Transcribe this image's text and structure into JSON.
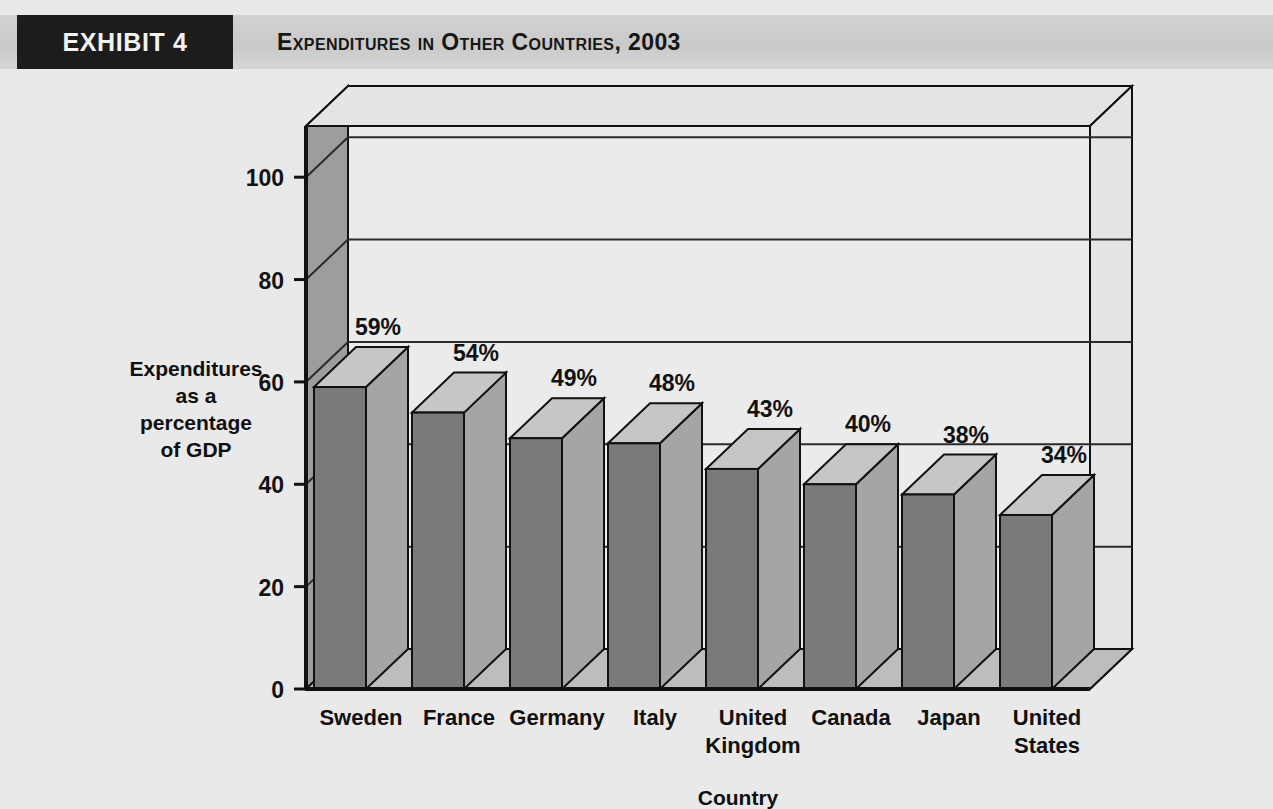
{
  "header": {
    "exhibit_tag": "EXHIBIT 4",
    "title": "Expenditures in Other Countries, 2003"
  },
  "colors": {
    "page_background": "#e9e9e9",
    "band_background": "#cdcdcd",
    "tag_background": "#1c1c1c",
    "tag_text": "#f2f2f2",
    "bar_front": "#7a7a7a",
    "bar_side": "#a5a5a5",
    "bar_top": "#c6c6c6",
    "plot_back_wall": "#ebebeb",
    "plot_left_wall": "#9d9d9d",
    "plot_floor": "#bdbdbd",
    "outline": "#111111",
    "gridline": "#2a2a2a"
  },
  "chart_data": {
    "type": "bar",
    "title": "Expenditures in Other Countries, 2003",
    "categories": [
      "Sweden",
      "France",
      "Germany",
      "Italy",
      "United Kingdom",
      "Canada",
      "Japan",
      "United States"
    ],
    "values": [
      59,
      54,
      49,
      48,
      43,
      40,
      38,
      34
    ],
    "data_labels": [
      "59%",
      "54%",
      "49%",
      "48%",
      "43%",
      "40%",
      "38%",
      "34%"
    ],
    "xlabel": "Country",
    "ylabel": "Expenditures as a percentage of GDP",
    "ylabel_lines": [
      "Expenditures",
      "as a",
      "percentage",
      "of GDP"
    ],
    "ytick_labels": [
      "0",
      "20",
      "40",
      "60",
      "80",
      "100"
    ],
    "yticks": [
      0,
      20,
      40,
      60,
      80,
      100
    ],
    "ylim": [
      0,
      110
    ],
    "grid": true,
    "legend": null,
    "style": "3d-column"
  },
  "category_label_lines": [
    [
      "Sweden"
    ],
    [
      "France"
    ],
    [
      "Germany"
    ],
    [
      "Italy"
    ],
    [
      "United",
      "Kingdom"
    ],
    [
      "Canada"
    ],
    [
      "Japan"
    ],
    [
      "United",
      "States"
    ]
  ]
}
